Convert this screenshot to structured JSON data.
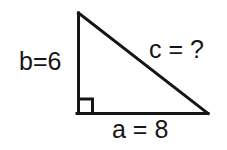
{
  "figure": {
    "kind": "right-triangle-geometry-diagram",
    "background_color": "#ffffff",
    "stroke_color": "#161616",
    "stroke_width": 3,
    "vertices": {
      "apex": [
        78,
        13
      ],
      "right_angle_corner": [
        78,
        113
      ],
      "base_right": [
        208,
        113
      ]
    },
    "right_angle_marker": {
      "present": true,
      "size": 14,
      "origin": [
        78,
        99
      ]
    }
  },
  "labels": {
    "leg_b": "b=6",
    "hypotenuse_c": "c = ?",
    "leg_a": "a = 8"
  },
  "values": {
    "b": 6,
    "a": 8,
    "c": "?"
  }
}
